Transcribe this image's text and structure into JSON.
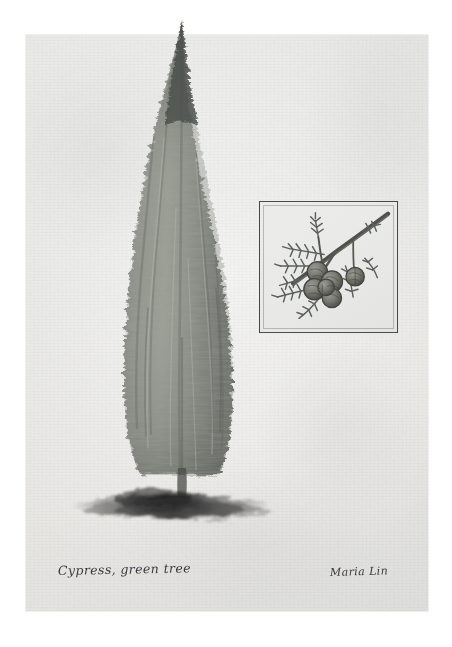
{
  "artwork": {
    "medium_appearance": "watercolour-and-ink botanical study on textured paper",
    "caption": "Cypress, green tree",
    "signature": "Maria Lin",
    "paper": {
      "base_color": "#e7e6e3",
      "edge_color": "#dededc"
    },
    "subject": {
      "name": "cypress-tree",
      "form": "tall narrow columnar silhouette with feathered ragged edges",
      "body_color": "#8f918a",
      "shade_color": "#646760",
      "highlight_color": "#b6b8b0",
      "tip_color": "#4e514c"
    },
    "ground_shadow": {
      "name": "ground-shadow",
      "color": "#2b2b2b",
      "description": "dark horizontal ink wash beneath the trunk"
    },
    "inset": {
      "title": "cypress-branch-detail",
      "description": "framed close-up study of a cypress branch bearing a cluster of round cones",
      "border_color": "#4a4a4a",
      "background_color": "#ececeb",
      "foliage_color": "#5d615a",
      "cone_color": "#6f706a",
      "branch_color": "#53544f",
      "cone_count": 6
    }
  }
}
